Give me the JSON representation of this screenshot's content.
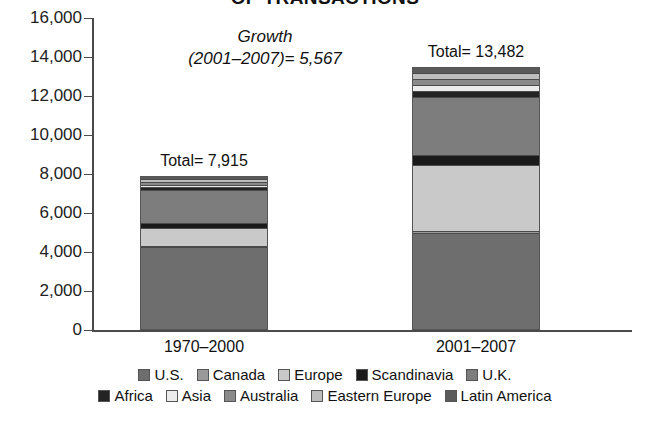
{
  "chart_data": {
    "type": "bar",
    "subtype": "stacked-bar",
    "title": "OF TRANSACTIONS",
    "xlabel": "",
    "ylabel": "",
    "ylim": [
      0,
      16000
    ],
    "ytick_labels": [
      "16,000",
      "14,000",
      "12,000",
      "10,000",
      "8,000",
      "6,000",
      "4,000",
      "2,000",
      "0"
    ],
    "ytick_values": [
      16000,
      14000,
      12000,
      10000,
      8000,
      6000,
      4000,
      2000,
      0
    ],
    "grid": false,
    "legend_position": "bottom",
    "categories": [
      "1970–2000",
      "2001–2007"
    ],
    "series": [
      {
        "name": "U.S.",
        "values": [
          4250,
          4950
        ],
        "color": "#6e6e6e"
      },
      {
        "name": "Canada",
        "values": [
          80,
          120
        ],
        "color": "#9a9a9a"
      },
      {
        "name": "Europe",
        "values": [
          900,
          3400
        ],
        "color": "#c9c9c9"
      },
      {
        "name": "Scandinavia",
        "values": [
          250,
          520
        ],
        "color": "#1a1a1a"
      },
      {
        "name": "U.K.",
        "values": [
          1680,
          2950
        ],
        "color": "#7d7d7d"
      },
      {
        "name": "Africa",
        "values": [
          180,
          330
        ],
        "color": "#242424"
      },
      {
        "name": "Asia",
        "values": [
          110,
          300
        ],
        "color": "#ececec"
      },
      {
        "name": "Australia",
        "values": [
          150,
          320
        ],
        "color": "#8a8a8a"
      },
      {
        "name": "Eastern Europe",
        "values": [
          120,
          290
        ],
        "color": "#bdbdbd"
      },
      {
        "name": "Latin America",
        "values": [
          195,
          312
        ],
        "color": "#5a5a5a"
      }
    ],
    "totals": [
      7915,
      13482
    ],
    "annotations": [
      {
        "text_line1": "Growth",
        "text_line2": "(2001–2007)= 5,567",
        "value": 5567
      }
    ]
  },
  "title": "OF TRANSACTIONS",
  "growth": {
    "line1": "Growth",
    "line2": "(2001–2007)= 5,567"
  },
  "axis": {
    "y_ticks": [
      {
        "label": "16,000"
      },
      {
        "label": "14,000"
      },
      {
        "label": "12,000"
      },
      {
        "label": "10,000"
      },
      {
        "label": "8,000"
      },
      {
        "label": "6,000"
      },
      {
        "label": "4,000"
      },
      {
        "label": "2,000"
      },
      {
        "label": "0"
      }
    ]
  },
  "bars": [
    {
      "category": "1970–2000",
      "total_label": "Total= 7,915",
      "total": 7915
    },
    {
      "category": "2001–2007",
      "total_label": "Total= 13,482",
      "total": 13482
    }
  ],
  "legend": {
    "row1": [
      {
        "label": "U.S.",
        "color": "#6e6e6e"
      },
      {
        "label": "Canada",
        "color": "#9a9a9a"
      },
      {
        "label": "Europe",
        "color": "#c9c9c9"
      },
      {
        "label": "Scandinavia",
        "color": "#1a1a1a"
      },
      {
        "label": "U.K.",
        "color": "#7d7d7d"
      }
    ],
    "row2": [
      {
        "label": "Africa",
        "color": "#242424"
      },
      {
        "label": "Asia",
        "color": "#ececec"
      },
      {
        "label": "Australia",
        "color": "#8a8a8a"
      },
      {
        "label": "Eastern Europe",
        "color": "#bdbdbd"
      },
      {
        "label": "Latin America",
        "color": "#5a5a5a"
      }
    ]
  }
}
